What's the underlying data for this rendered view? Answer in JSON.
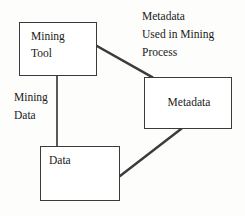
{
  "diagram": {
    "background_color": "#fdfdfc",
    "stroke_color": "#3b3b3b",
    "text_color": "#1a1a1a",
    "nodes": [
      {
        "id": "mining-tool",
        "label": "Mining\nTool",
        "shape": "rectangle",
        "x": 19,
        "y": 22,
        "width": 78,
        "height": 54
      },
      {
        "id": "metadata",
        "label": "Metadata",
        "shape": "rectangle",
        "x": 144,
        "y": 77,
        "width": 88,
        "height": 52
      },
      {
        "id": "data",
        "label": "Data",
        "shape": "rectangle",
        "x": 40,
        "y": 146,
        "width": 80,
        "height": 55
      }
    ],
    "edges": [
      {
        "id": "edge-mining-tool-metadata",
        "from": "mining-tool",
        "to": "metadata",
        "label": "Metadata\nUsed in Mining\nProcess",
        "x1": 97,
        "y1": 46,
        "x2": 152,
        "y2": 77
      },
      {
        "id": "edge-mining-tool-data",
        "from": "mining-tool",
        "to": "data",
        "label": "Mining\nData",
        "x1": 57,
        "y1": 76,
        "x2": 57,
        "y2": 146
      },
      {
        "id": "edge-data-metadata",
        "from": "data",
        "to": "metadata",
        "label": "",
        "x1": 120,
        "y1": 176,
        "x2": 181,
        "y2": 129
      }
    ],
    "labels": [
      {
        "id": "label-metadata-used",
        "text": "Metadata\nUsed in Mining\nProcess",
        "x": 142,
        "y": 8
      },
      {
        "id": "label-mining-data",
        "text": "Mining\nData",
        "x": 14,
        "y": 89
      }
    ]
  }
}
